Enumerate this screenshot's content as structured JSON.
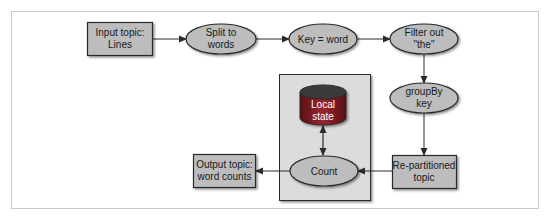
{
  "diagram": {
    "colors": {
      "frame": "#c9c9c9",
      "node_fill": "#bdbdbd",
      "node_stroke": "#2b2b2b",
      "container_fill": "#dcdcdc",
      "db_fill": "#8a1c24",
      "db_top": "#3a3a3a",
      "arrow": "#2b2b2b"
    },
    "nodes": {
      "input_topic": {
        "shape": "rect",
        "line1": "Input topic:",
        "line2": "Lines"
      },
      "split": {
        "shape": "ellipse",
        "line1": "Split to",
        "line2": "words"
      },
      "key": {
        "shape": "ellipse",
        "line1": "Key = word"
      },
      "filter": {
        "shape": "ellipse",
        "line1": "Filter out",
        "line2": "\"the\""
      },
      "groupby": {
        "shape": "ellipse",
        "line1": "groupBy",
        "line2": "key"
      },
      "repartitioned": {
        "shape": "rect",
        "line1": "Re-partitioned",
        "line2": "topic"
      },
      "local_state": {
        "shape": "cylinder",
        "line1": "Local",
        "line2": "state"
      },
      "count": {
        "shape": "ellipse",
        "line1": "Count"
      },
      "output_topic": {
        "shape": "rect",
        "line1": "Output topic:",
        "line2": "word counts"
      }
    },
    "edges": [
      {
        "from": "input_topic",
        "to": "split"
      },
      {
        "from": "split",
        "to": "key"
      },
      {
        "from": "key",
        "to": "filter"
      },
      {
        "from": "filter",
        "to": "groupby"
      },
      {
        "from": "groupby",
        "to": "repartitioned"
      },
      {
        "from": "repartitioned",
        "to": "count"
      },
      {
        "from": "count",
        "to": "local_state",
        "bidirectional": true
      },
      {
        "from": "count",
        "to": "output_topic"
      }
    ]
  }
}
